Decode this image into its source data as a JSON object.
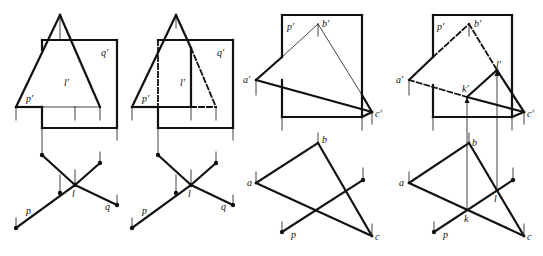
{
  "colors": {
    "ink": "#111111",
    "background": "#ffffff"
  },
  "figures": [
    {
      "id": "fig1",
      "thick": [
        [
          [
            16,
            107
          ],
          [
            60,
            15
          ]
        ],
        [
          [
            60,
            15
          ],
          [
            100,
            107
          ]
        ],
        [
          [
            16,
            107
          ],
          [
            42,
            107
          ]
        ],
        [
          [
            42,
            107
          ],
          [
            42,
            128
          ]
        ],
        [
          [
            42,
            40
          ],
          [
            117,
            40
          ]
        ],
        [
          [
            117,
            40
          ],
          [
            117,
            128
          ]
        ],
        [
          [
            42,
            128
          ],
          [
            117,
            128
          ]
        ],
        [
          [
            42,
            40
          ],
          [
            42,
            50
          ]
        ],
        [
          [
            42,
            155
          ],
          [
            75,
            185
          ]
        ],
        [
          [
            75,
            185
          ],
          [
            117,
            205
          ]
        ],
        [
          [
            16,
            228
          ],
          [
            75,
            185
          ]
        ],
        [
          [
            75,
            185
          ],
          [
            100,
            163
          ]
        ]
      ],
      "thin": [
        [
          [
            60,
            15
          ],
          [
            60,
            40
          ]
        ],
        [
          [
            42,
            107
          ],
          [
            100,
            107
          ]
        ],
        [
          [
            75,
            107
          ],
          [
            75,
            120
          ]
        ],
        [
          [
            16,
            107
          ],
          [
            16,
            120
          ]
        ],
        [
          [
            100,
            107
          ],
          [
            100,
            120
          ]
        ],
        [
          [
            42,
            128
          ],
          [
            42,
            155
          ]
        ],
        [
          [
            117,
            128
          ],
          [
            117,
            140
          ]
        ],
        [
          [
            75,
            170
          ],
          [
            75,
            185
          ]
        ],
        [
          [
            60,
            175
          ],
          [
            60,
            193
          ]
        ],
        [
          [
            100,
            152
          ],
          [
            100,
            163
          ]
        ],
        [
          [
            117,
            195
          ],
          [
            117,
            205
          ]
        ],
        [
          [
            16,
            218
          ],
          [
            16,
            228
          ]
        ]
      ],
      "dashed": [],
      "dots": [
        [
          42,
          155
        ],
        [
          100,
          163
        ],
        [
          60,
          193
        ],
        [
          75,
          185
        ],
        [
          117,
          205
        ],
        [
          16,
          228
        ]
      ],
      "labels": [
        {
          "text": "q′",
          "x": 101,
          "y": 56
        },
        {
          "text": "l′",
          "x": 64,
          "y": 86
        },
        {
          "text": "p′",
          "x": 26,
          "y": 102
        },
        {
          "text": "l",
          "x": 72,
          "y": 197
        },
        {
          "text": "p",
          "x": 26,
          "y": 214
        },
        {
          "text": "q",
          "x": 105,
          "y": 210
        }
      ]
    },
    {
      "id": "fig2",
      "thick": [
        [
          [
            132,
            107
          ],
          [
            176,
            15
          ]
        ],
        [
          [
            176,
            15
          ],
          [
            191,
            48
          ]
        ],
        [
          [
            132,
            107
          ],
          [
            158,
            107
          ]
        ],
        [
          [
            158,
            40
          ],
          [
            233,
            40
          ]
        ],
        [
          [
            233,
            40
          ],
          [
            233,
            128
          ]
        ],
        [
          [
            158,
            107
          ],
          [
            158,
            128
          ]
        ],
        [
          [
            158,
            128
          ],
          [
            233,
            128
          ]
        ],
        [
          [
            191,
            48
          ],
          [
            191,
            107
          ]
        ],
        [
          [
            158,
            107
          ],
          [
            191,
            107
          ]
        ],
        [
          [
            158,
            155
          ],
          [
            191,
            185
          ]
        ],
        [
          [
            191,
            185
          ],
          [
            233,
            205
          ]
        ],
        [
          [
            132,
            228
          ],
          [
            191,
            185
          ]
        ],
        [
          [
            191,
            185
          ],
          [
            216,
            163
          ]
        ]
      ],
      "thin": [
        [
          [
            176,
            15
          ],
          [
            176,
            28
          ]
        ],
        [
          [
            132,
            107
          ],
          [
            132,
            120
          ]
        ],
        [
          [
            191,
            107
          ],
          [
            191,
            120
          ]
        ],
        [
          [
            216,
            107
          ],
          [
            216,
            120
          ]
        ],
        [
          [
            158,
            128
          ],
          [
            158,
            155
          ]
        ],
        [
          [
            233,
            128
          ],
          [
            233,
            140
          ]
        ],
        [
          [
            191,
            170
          ],
          [
            191,
            185
          ]
        ],
        [
          [
            176,
            175
          ],
          [
            176,
            193
          ]
        ],
        [
          [
            216,
            152
          ],
          [
            216,
            163
          ]
        ],
        [
          [
            233,
            195
          ],
          [
            233,
            205
          ]
        ],
        [
          [
            132,
            218
          ],
          [
            132,
            228
          ]
        ]
      ],
      "dashed": [
        [
          [
            158,
            40
          ],
          [
            158,
            107
          ]
        ],
        [
          [
            158,
            40
          ],
          [
            191,
            40
          ]
        ],
        [
          [
            191,
            48
          ],
          [
            216,
            107
          ]
        ],
        [
          [
            191,
            107
          ],
          [
            216,
            107
          ]
        ]
      ],
      "dots": [
        [
          158,
          155
        ],
        [
          216,
          163
        ],
        [
          176,
          193
        ],
        [
          191,
          185
        ],
        [
          233,
          205
        ],
        [
          132,
          228
        ]
      ],
      "labels": [
        {
          "text": "q′",
          "x": 217,
          "y": 56
        },
        {
          "text": "l′",
          "x": 180,
          "y": 86
        },
        {
          "text": "p′",
          "x": 142,
          "y": 102
        },
        {
          "text": "l",
          "x": 188,
          "y": 197
        },
        {
          "text": "p",
          "x": 142,
          "y": 214
        },
        {
          "text": "q",
          "x": 221,
          "y": 210
        }
      ]
    },
    {
      "id": "fig3",
      "thick": [
        [
          [
            282,
            15
          ],
          [
            362,
            15
          ]
        ],
        [
          [
            362,
            15
          ],
          [
            362,
            117
          ]
        ],
        [
          [
            282,
            117
          ],
          [
            362,
            117
          ]
        ],
        [
          [
            282,
            15
          ],
          [
            282,
            57
          ]
        ],
        [
          [
            282,
            80
          ],
          [
            282,
            117
          ]
        ],
        [
          [
            256,
            80
          ],
          [
            282,
            57
          ]
        ],
        [
          [
            256,
            80
          ],
          [
            372,
            112
          ]
        ],
        [
          [
            362,
            95
          ],
          [
            372,
            112
          ]
        ],
        [
          [
            362,
            117
          ],
          [
            372,
            112
          ]
        ],
        [
          [
            256,
            183
          ],
          [
            318,
            143
          ]
        ],
        [
          [
            256,
            183
          ],
          [
            372,
            236
          ]
        ],
        [
          [
            318,
            143
          ],
          [
            372,
            236
          ]
        ],
        [
          [
            282,
            232
          ],
          [
            363,
            180
          ]
        ]
      ],
      "thin": [
        [
          [
            318,
            24
          ],
          [
            318,
            36
          ]
        ],
        [
          [
            282,
            57
          ],
          [
            318,
            24
          ]
        ],
        [
          [
            318,
            24
          ],
          [
            362,
            95
          ]
        ],
        [
          [
            256,
            80
          ],
          [
            256,
            95
          ]
        ],
        [
          [
            282,
            117
          ],
          [
            282,
            130
          ]
        ],
        [
          [
            362,
            117
          ],
          [
            362,
            130
          ]
        ],
        [
          [
            372,
            112
          ],
          [
            372,
            124
          ]
        ],
        [
          [
            318,
            133
          ],
          [
            318,
            143
          ]
        ],
        [
          [
            256,
            172
          ],
          [
            256,
            183
          ]
        ],
        [
          [
            363,
            168
          ],
          [
            363,
            180
          ]
        ],
        [
          [
            282,
            222
          ],
          [
            282,
            232
          ]
        ],
        [
          [
            372,
            224
          ],
          [
            372,
            236
          ]
        ]
      ],
      "dashed": [],
      "dots": [
        [
          363,
          180
        ],
        [
          282,
          232
        ]
      ],
      "labels": [
        {
          "text": "p′",
          "x": 287,
          "y": 30
        },
        {
          "text": "b′",
          "x": 322,
          "y": 27
        },
        {
          "text": "a′",
          "x": 243,
          "y": 83
        },
        {
          "text": "c′",
          "x": 375,
          "y": 117
        },
        {
          "text": "b",
          "x": 322,
          "y": 143
        },
        {
          "text": "a",
          "x": 247,
          "y": 186
        },
        {
          "text": "p",
          "x": 291,
          "y": 238
        },
        {
          "text": "c",
          "x": 375,
          "y": 240
        }
      ]
    },
    {
      "id": "fig4",
      "thick": [
        [
          [
            433,
            15
          ],
          [
            512,
            15
          ]
        ],
        [
          [
            512,
            15
          ],
          [
            512,
            117
          ]
        ],
        [
          [
            433,
            117
          ],
          [
            512,
            117
          ]
        ],
        [
          [
            433,
            15
          ],
          [
            433,
            57
          ]
        ],
        [
          [
            433,
            85
          ],
          [
            433,
            117
          ]
        ],
        [
          [
            409,
            80
          ],
          [
            433,
            57
          ]
        ],
        [
          [
            467,
            97
          ],
          [
            524,
            112
          ]
        ],
        [
          [
            467,
            97
          ],
          [
            497,
            70
          ]
        ],
        [
          [
            497,
            70
          ],
          [
            524,
            112
          ]
        ],
        [
          [
            512,
            117
          ],
          [
            524,
            112
          ]
        ],
        [
          [
            409,
            183
          ],
          [
            469,
            143
          ]
        ],
        [
          [
            409,
            183
          ],
          [
            524,
            236
          ]
        ],
        [
          [
            469,
            143
          ],
          [
            524,
            236
          ]
        ],
        [
          [
            434,
            232
          ],
          [
            513,
            180
          ]
        ]
      ],
      "thin": [
        [
          [
            469,
            24
          ],
          [
            469,
            36
          ]
        ],
        [
          [
            409,
            80
          ],
          [
            409,
            95
          ]
        ],
        [
          [
            433,
            117
          ],
          [
            433,
            130
          ]
        ],
        [
          [
            512,
            117
          ],
          [
            512,
            130
          ]
        ],
        [
          [
            524,
            112
          ],
          [
            524,
            124
          ]
        ],
        [
          [
            467,
            97
          ],
          [
            467,
            210
          ]
        ],
        [
          [
            497,
            70
          ],
          [
            497,
            190
          ]
        ],
        [
          [
            469,
            133
          ],
          [
            469,
            143
          ]
        ],
        [
          [
            409,
            172
          ],
          [
            409,
            183
          ]
        ],
        [
          [
            513,
            168
          ],
          [
            513,
            180
          ]
        ],
        [
          [
            434,
            222
          ],
          [
            434,
            232
          ]
        ],
        [
          [
            524,
            224
          ],
          [
            524,
            236
          ]
        ]
      ],
      "dashed": [
        [
          [
            433,
            57
          ],
          [
            469,
            24
          ]
        ],
        [
          [
            469,
            24
          ],
          [
            497,
            70
          ]
        ],
        [
          [
            409,
            80
          ],
          [
            467,
            97
          ]
        ]
      ],
      "arrows": [
        [
          467,
          97
        ],
        [
          497,
          70
        ]
      ],
      "dots": [
        [
          513,
          180
        ],
        [
          434,
          232
        ]
      ],
      "labels": [
        {
          "text": "p′",
          "x": 437,
          "y": 30
        },
        {
          "text": "b′",
          "x": 474,
          "y": 27
        },
        {
          "text": "l′",
          "x": 496,
          "y": 68
        },
        {
          "text": "k′",
          "x": 462,
          "y": 92
        },
        {
          "text": "a′",
          "x": 396,
          "y": 83
        },
        {
          "text": "c′",
          "x": 527,
          "y": 117
        },
        {
          "text": "b",
          "x": 472,
          "y": 146
        },
        {
          "text": "a",
          "x": 399,
          "y": 186
        },
        {
          "text": "l",
          "x": 494,
          "y": 202
        },
        {
          "text": "k",
          "x": 464,
          "y": 222
        },
        {
          "text": "p",
          "x": 443,
          "y": 238
        },
        {
          "text": "c",
          "x": 527,
          "y": 240
        }
      ]
    }
  ]
}
